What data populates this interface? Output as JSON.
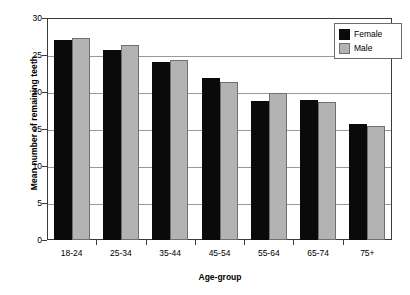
{
  "chart_data": {
    "type": "bar",
    "title": "",
    "subtitle": "",
    "xlabel": "Age-group",
    "ylabel": "Mean number of remaining teeth",
    "categories": [
      "18-24",
      "25-34",
      "35-44",
      "45-54",
      "55-64",
      "65-74",
      "75+"
    ],
    "series": [
      {
        "name": "Female",
        "color": "#0a0a0a",
        "values": [
          27.0,
          25.7,
          24.1,
          21.9,
          18.8,
          18.9,
          15.7
        ]
      },
      {
        "name": "Male",
        "color": "#b3b3b3",
        "values": [
          27.3,
          26.3,
          24.3,
          21.4,
          19.9,
          18.6,
          15.4
        ]
      }
    ],
    "ylim": [
      0,
      30
    ],
    "ytick_labels": [
      "0",
      "5",
      "10",
      "15",
      "20",
      "25",
      "30"
    ],
    "ytick_values": [
      0,
      5,
      10,
      15,
      20,
      25,
      30
    ],
    "grid": true,
    "grid_axis": "y",
    "legend_position": "top-right",
    "legend_entries": [
      "Female",
      "Male"
    ]
  }
}
